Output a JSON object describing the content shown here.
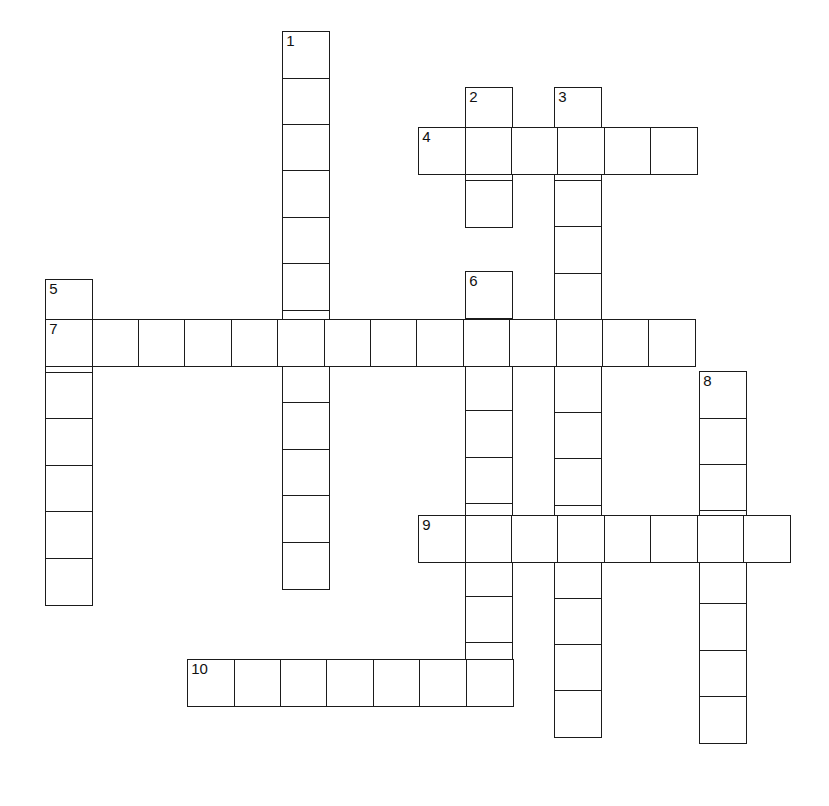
{
  "puzzle": {
    "title": "Crossword Puzzle Grid",
    "cell_size": 48,
    "grid_line_color": "#1b1b1b",
    "cell_fill_color": "#ffffff",
    "background_color": "#ffffff",
    "canvas_width": 829,
    "canvas_height": 806,
    "total_entries": 10,
    "across_count": 4,
    "down_count": 6,
    "entries": [
      {
        "number": "1",
        "direction": "down",
        "length": 12,
        "x": 283,
        "y": 32,
        "label": "1-down"
      },
      {
        "number": "2",
        "direction": "down",
        "length": 3,
        "x": 466,
        "y": 88,
        "label": "2-down"
      },
      {
        "number": "3",
        "direction": "down",
        "length": 14,
        "x": 555,
        "y": 88,
        "label": "3-down"
      },
      {
        "number": "4",
        "direction": "across",
        "length": 6,
        "x": 419,
        "y": 128,
        "label": "4-across"
      },
      {
        "number": "5",
        "direction": "down",
        "length": 7,
        "x": 46,
        "y": 280,
        "label": "5-down"
      },
      {
        "number": "6",
        "direction": "down",
        "length": 9,
        "x": 466,
        "y": 272,
        "label": "6-down"
      },
      {
        "number": "7",
        "direction": "across",
        "length": 14,
        "x": 46,
        "y": 320,
        "label": "7-across"
      },
      {
        "number": "8",
        "direction": "down",
        "length": 8,
        "x": 700,
        "y": 372,
        "label": "8-down"
      },
      {
        "number": "9",
        "direction": "across",
        "length": 8,
        "x": 419,
        "y": 516,
        "label": "9-across"
      },
      {
        "number": "10",
        "direction": "across",
        "length": 7,
        "x": 188,
        "y": 660,
        "label": "10-across"
      }
    ]
  }
}
